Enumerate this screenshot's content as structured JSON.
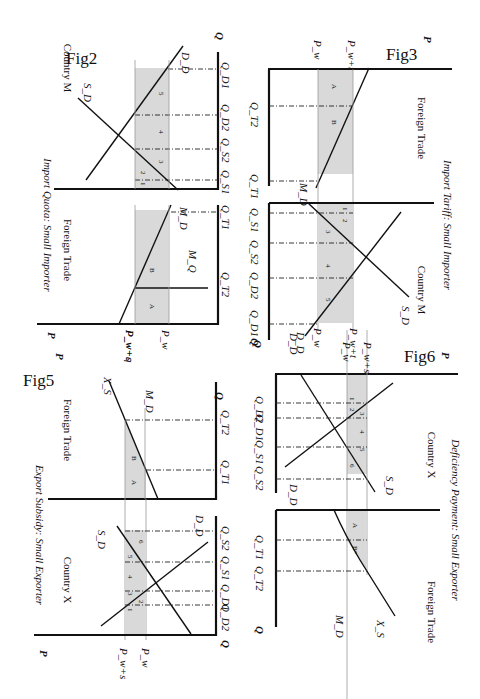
{
  "page": {
    "orientation": "rotated 90 degrees clockwise",
    "shade_color": "#d9d9d9",
    "line_color": "#111111"
  },
  "fig2": {
    "label": "Fig2",
    "title": "Import Quota: Small Importer",
    "left_panel": "Foreign Trade",
    "right_panel": "Country M",
    "axis_p": "P",
    "axis_q": "Q",
    "price_high": "P_w+q",
    "price_low": "P_w",
    "curves": {
      "supply": "S_D",
      "demand": "D_D",
      "import_demand": "M_D",
      "quota": "M_Q"
    },
    "q_labels": {
      "qt1": "Q_T1",
      "qt2": "Q_T2",
      "qs1": "Q_S1",
      "qs2": "Q_S2",
      "qd2": "Q_D2",
      "qd1": "Q_D1"
    },
    "areas": {
      "a": "A",
      "b": "B",
      "n1": "1",
      "n2": "2",
      "n3": "3",
      "n4": "4",
      "n5": "5"
    }
  },
  "fig3": {
    "label": "Fig3",
    "title": "Import Tariff: Small Importer",
    "left_panel": "Foreign Trade",
    "right_panel": "Country M",
    "axis_p": "P",
    "axis_q": "Q",
    "price_high": "P_w+t",
    "price_low": "P_w",
    "curves": {
      "supply": "S_D",
      "demand": "D_D",
      "import_demand": "M_D"
    },
    "q_labels": {
      "qt1": "Q_T1",
      "qt2": "Q_T2",
      "qs1": "Q_S1",
      "qs2": "Q_S2",
      "qd2": "Q_D2",
      "qd1": "Q_D1"
    },
    "areas": {
      "a": "A",
      "b": "B",
      "n1": "1",
      "n2": "2",
      "n3": "3",
      "n4": "4",
      "n5": "5"
    }
  },
  "fig5": {
    "label": "Fig5",
    "title": "Export Subsidy: Small Exporter",
    "left_panel": "Foreign Trade",
    "right_panel": "Country X",
    "axis_p": "P",
    "axis_q": "Q",
    "price_high": "P_w+s",
    "price_low": "P_w",
    "curves": {
      "supply": "S_D",
      "demand": "D_D",
      "export_supply": "X_S",
      "import_demand": "M_D"
    },
    "q_labels": {
      "qt1": "Q_T1",
      "qt2": "Q_T2",
      "qd2": "Q_D2",
      "qd1": "Q_D1",
      "qs1": "Q_S1",
      "qs2": "Q_S2"
    },
    "areas": {
      "a": "A",
      "b": "B",
      "n1": "1",
      "n2": "2",
      "n3": "3",
      "n4": "4",
      "n5": "5",
      "n6": "6"
    }
  },
  "fig6": {
    "label": "Fig6",
    "title": "Deficiency Payment: Small Exporter",
    "left_panel": "Country X",
    "right_panel": "Foreign Trade",
    "axis_p": "P",
    "axis_q": "Q",
    "price_high": "P_w+s",
    "price_low": "P_w",
    "curves": {
      "supply": "S_D",
      "demand": "D_D",
      "export_supply": "X_S",
      "import_demand": "M_D"
    },
    "q_labels": {
      "qt1": "Q_T1",
      "qt2": "Q_T2",
      "qd2": "Q_D2",
      "qd1": "Q_D1",
      "qs1": "Q_S1",
      "qs2": "Q_S2"
    },
    "areas": {
      "a": "A",
      "b": "B*",
      "n1": "1",
      "n2": "2",
      "n3": "3",
      "n4": "4",
      "n5": "5",
      "n6": "6"
    }
  }
}
